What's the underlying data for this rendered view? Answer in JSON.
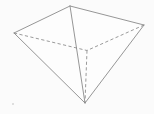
{
  "figure": {
    "shape_name": "tetrahedron",
    "canvas": {
      "width": 154,
      "height": 114,
      "background_color": "#fbfbfb"
    },
    "style": {
      "solid_edge_color": "#8a8a8a",
      "hidden_edge_color": "#8f8f8f",
      "stroke_width": 0.9,
      "dash_pattern": "3.2 2.4",
      "face_fill_color": "#fdfdfd"
    },
    "vertices": [
      {
        "id": "left",
        "label": "left vertex",
        "x": 14,
        "y": 33,
        "visible": true
      },
      {
        "id": "top",
        "label": "top vertex",
        "x": 70,
        "y": 6,
        "visible": true
      },
      {
        "id": "right",
        "label": "right vertex",
        "x": 144,
        "y": 25,
        "visible": true
      },
      {
        "id": "back",
        "label": "hidden back vertex",
        "x": 87,
        "y": 50.5,
        "visible": false
      },
      {
        "id": "apex",
        "label": "bottom apex vertex",
        "x": 85,
        "y": 103,
        "visible": true
      }
    ],
    "edges": [
      {
        "id": "left-top",
        "from": "left",
        "to": "top",
        "hidden": false
      },
      {
        "id": "top-right",
        "from": "top",
        "to": "right",
        "hidden": false
      },
      {
        "id": "left-apex",
        "from": "left",
        "to": "apex",
        "hidden": false
      },
      {
        "id": "right-apex",
        "from": "right",
        "to": "apex",
        "hidden": false
      },
      {
        "id": "top-apex",
        "from": "top",
        "to": "apex",
        "hidden": false
      },
      {
        "id": "left-back",
        "from": "left",
        "to": "back",
        "hidden": true
      },
      {
        "id": "right-back",
        "from": "right",
        "to": "back",
        "hidden": true
      },
      {
        "id": "back-apex",
        "from": "back",
        "to": "apex",
        "hidden": true
      }
    ],
    "artifacts": [
      {
        "id": "speck-bottom-left",
        "label": "scan speck",
        "x": 13,
        "y": 104,
        "r": 1.1
      }
    ]
  }
}
